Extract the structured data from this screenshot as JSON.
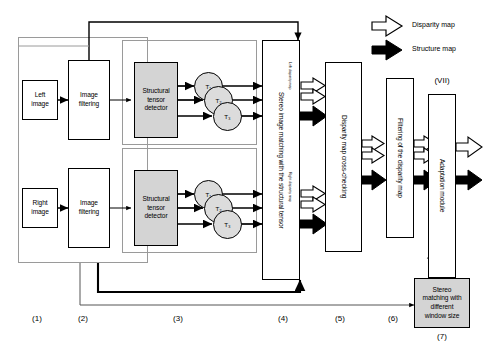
{
  "diagram": {
    "title_absent": true,
    "legend": [
      {
        "name": "disparity-map",
        "label": "Disparity map",
        "arrow": "hollow",
        "color": "#ffffff"
      },
      {
        "name": "structure-map",
        "label": "Structure map",
        "arrow": "filled",
        "color": "#000000"
      }
    ],
    "stages": [
      {
        "id": "1",
        "label": "(1)"
      },
      {
        "id": "2",
        "label": "(2)"
      },
      {
        "id": "3",
        "label": "(3)"
      },
      {
        "id": "4",
        "label": "(4)"
      },
      {
        "id": "5",
        "label": "(5)"
      },
      {
        "id": "6",
        "label": "(6)"
      },
      {
        "id": "7",
        "label": "(7)"
      }
    ],
    "blocks": {
      "left_image": "Left\nimage",
      "left_image_l1": "Left",
      "left_image_l2": "image",
      "right_image_l1": "Right",
      "right_image_l2": "image",
      "image_filtering_l1": "Image",
      "image_filtering_l2": "filtering",
      "structural_tensor_detector_l1": "Structural",
      "structural_tensor_detector_l2": "tensor",
      "structural_tensor_detector_l3": "detector",
      "stereo_matching": "Stereo image matching with the structural tensor",
      "disparity_cross_checking": "Disparity map cross-checking",
      "filtering_disparity": "Filtering of the disparity map",
      "adaptation_module": "Adaptation module",
      "adaptation_tag": "(VII)",
      "stereo_window_l1": "Stereo",
      "stereo_window_l2": "matching with",
      "stereo_window_l3": "different",
      "stereo_window_l4": "window size"
    },
    "tensor_nodes_top": [
      "T₁",
      "T₂",
      "T₃"
    ],
    "tensor_nodes_bottom": [
      "T₁",
      "T₂",
      "T₃"
    ],
    "inline_labels": {
      "left_disparity_map": "Left disparity map",
      "right_disparity_map": "Right disparity map"
    },
    "colors": {
      "fill_gray": "#d4d4d4",
      "node_gray": "#dcdcdc",
      "stroke": "#000000",
      "group_stroke": "#9a9a9a",
      "page": "#ffffff"
    }
  }
}
